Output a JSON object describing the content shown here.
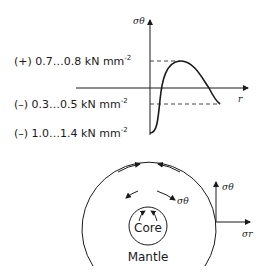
{
  "graph": {
    "y_axis_label": "σθ",
    "x_axis_label": "r",
    "levels": [
      {
        "sign": "(+)",
        "range": "0.7…0.8",
        "unit": "kN mm",
        "exp": "-2"
      },
      {
        "sign": "(–)",
        "range": "0.3…0.5",
        "unit": "kN mm",
        "exp": "-2"
      },
      {
        "sign": "(–)",
        "range": "1.0…1.4",
        "unit": "kN mm",
        "exp": "-2"
      }
    ]
  },
  "section": {
    "core_label": "Core",
    "mantle_label": "Mantle",
    "tangential_label": "σθ",
    "edge_tangential_label": "σθ",
    "edge_radial_label": "σr"
  }
}
